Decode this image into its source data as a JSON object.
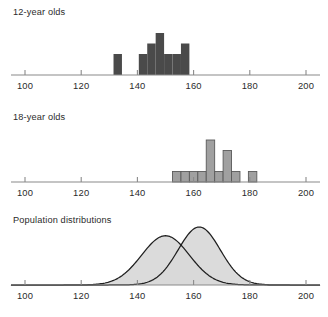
{
  "figure": {
    "width": 328,
    "height": 317,
    "background": "#ffffff"
  },
  "axis": {
    "ticks": [
      100,
      120,
      140,
      160,
      180,
      200
    ],
    "tick_labels": [
      "100",
      "120",
      "140",
      "160",
      "180",
      "200"
    ],
    "xmin": 95,
    "xmax": 205,
    "axis_color": "#8a8a8a"
  },
  "panels": {
    "twelve": {
      "title": "12-year olds"
    },
    "eighteen": {
      "title": "18-year olds"
    },
    "population": {
      "title": "Population distributions"
    }
  },
  "colors": {
    "bars_12": "#4a4a4a",
    "bars_18": "#a0a0a0",
    "bars_18_stroke": "#5a5a5a",
    "curve_fill": "#d9d9d9",
    "curve_stroke": "#1f1f1f",
    "axis": "#8a8a8a",
    "text": "#2b2b2b"
  },
  "chart_data": [
    {
      "type": "bar",
      "title": "12-year olds",
      "xlabel": "",
      "ylabel": "",
      "xlim": [
        95,
        205
      ],
      "ylim": [
        0,
        5
      ],
      "grid": false,
      "legend": "none",
      "bin_width": 3,
      "categories": [
        133,
        142,
        145,
        148,
        151,
        154,
        157
      ],
      "values": [
        2,
        2,
        3,
        4,
        2,
        2,
        3
      ],
      "bin_starts": [
        131.5,
        140.5,
        143.5,
        146.5,
        149.5,
        152.5,
        155.5
      ]
    },
    {
      "type": "bar",
      "title": "18-year olds",
      "xlabel": "",
      "ylabel": "",
      "xlim": [
        95,
        205
      ],
      "ylim": [
        0,
        5
      ],
      "grid": false,
      "legend": "none",
      "bin_width": 3,
      "categories": [
        154,
        157,
        160,
        163,
        166,
        169,
        172,
        175,
        181
      ],
      "values": [
        1,
        1,
        1,
        1,
        4,
        1,
        3,
        1,
        1
      ],
      "bin_starts": [
        152.5,
        155.5,
        158.5,
        161.5,
        164.5,
        167.5,
        170.5,
        173.5,
        179.5
      ],
      "note": "bars at 166 and 169 are taller; tall bar height 4, medium 3"
    },
    {
      "type": "line",
      "title": "Population distributions",
      "xlabel": "",
      "ylabel": "",
      "xlim": [
        95,
        205
      ],
      "ylim": [
        0,
        1.15
      ],
      "grid": false,
      "legend": "none",
      "series": [
        {
          "name": "12-year olds population",
          "distribution": "normal",
          "mean": 150,
          "sd": 8.5,
          "peak_height": 0.85,
          "fill": "#d9d9d9"
        },
        {
          "name": "18-year olds population",
          "distribution": "normal",
          "mean": 162,
          "sd": 7.5,
          "peak_height": 1.0,
          "fill": "#d9d9d9"
        }
      ]
    }
  ]
}
